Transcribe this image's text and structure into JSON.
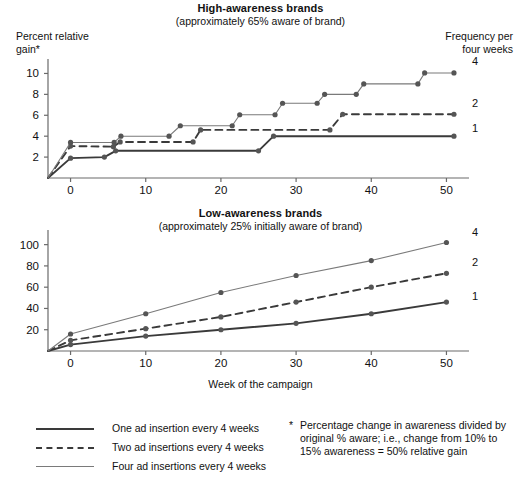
{
  "top": {
    "title": "High-awareness brands",
    "subtitle": "(approximately 65% aware of brand)",
    "ylabel": "Percent relative\ngain*",
    "right_header": "Frequency per\nfour weeks",
    "series_labels": {
      "four": "4",
      "two": "2",
      "one": "1"
    }
  },
  "bottom": {
    "title": "Low-awareness brands",
    "subtitle": "(approximately 25% initially aware of brand)",
    "xlabel": "Week of the campaign",
    "series_labels": {
      "four": "4",
      "two": "2",
      "one": "1"
    }
  },
  "legend": {
    "items": [
      {
        "style": "solid-dark",
        "label": "One ad insertion every 4 weeks"
      },
      {
        "style": "dashed",
        "label": "Two ad insertions every 4 weeks"
      },
      {
        "style": "solid-light",
        "label": "Four ad insertions every 4 weeks"
      }
    ]
  },
  "footnote": {
    "marker": "*",
    "text": "Percentage change in awareness divided by original % aware; i.e., change from 10% to 15% awareness = 50% relative gain"
  },
  "colors": {
    "dark_line": "#3a3a3a",
    "light_line": "#7a7a7a",
    "axis": "#6a6a6a",
    "marker": "#555555",
    "text": "#111111"
  },
  "chart_data": [
    {
      "type": "line",
      "id": "high-awareness",
      "title": "High-awareness brands",
      "subtitle": "(approximately 65% aware of brand)",
      "xlabel": "",
      "ylabel": "Percent relative gain*",
      "xlim": [
        -3,
        53
      ],
      "ylim": [
        0,
        11
      ],
      "xticks": [
        0,
        10,
        20,
        30,
        40,
        50
      ],
      "yticks": [
        2,
        4,
        6,
        8,
        10
      ],
      "grid": false,
      "legend_position": "right-of-plot",
      "note": "step-shaped curves; values are percent relative gain",
      "series": [
        {
          "name": "1",
          "legend": "One ad insertion every 4 weeks",
          "style": "solid-dark",
          "points": [
            {
              "x": -3.0,
              "y": 0.0
            },
            {
              "x": 0.0,
              "y": 1.9
            },
            {
              "x": 4.5,
              "y": 2.0
            },
            {
              "x": 6.0,
              "y": 2.6
            },
            {
              "x": 25.0,
              "y": 2.6
            },
            {
              "x": 27.0,
              "y": 4.0
            },
            {
              "x": 51.0,
              "y": 4.0
            }
          ]
        },
        {
          "name": "2",
          "legend": "Two ad insertions every 4 weeks",
          "style": "dashed",
          "points": [
            {
              "x": -3.0,
              "y": 0.0
            },
            {
              "x": 0.0,
              "y": 3.05
            },
            {
              "x": 5.7,
              "y": 3.0
            },
            {
              "x": 6.6,
              "y": 3.45
            },
            {
              "x": 16.3,
              "y": 3.45
            },
            {
              "x": 17.3,
              "y": 4.6
            },
            {
              "x": 34.5,
              "y": 4.6
            },
            {
              "x": 36.2,
              "y": 6.1
            },
            {
              "x": 51.0,
              "y": 6.1
            }
          ]
        },
        {
          "name": "4",
          "legend": "Four ad insertions every 4 weeks",
          "style": "solid-light",
          "points": [
            {
              "x": -3.0,
              "y": 0.0
            },
            {
              "x": 0.0,
              "y": 3.4
            },
            {
              "x": 5.8,
              "y": 3.4
            },
            {
              "x": 6.7,
              "y": 4.0
            },
            {
              "x": 13.1,
              "y": 4.0
            },
            {
              "x": 14.6,
              "y": 5.0
            },
            {
              "x": 21.5,
              "y": 5.0
            },
            {
              "x": 22.5,
              "y": 6.05
            },
            {
              "x": 27.2,
              "y": 6.05
            },
            {
              "x": 28.2,
              "y": 7.15
            },
            {
              "x": 32.8,
              "y": 7.15
            },
            {
              "x": 33.8,
              "y": 8.0
            },
            {
              "x": 38.0,
              "y": 8.0
            },
            {
              "x": 39.0,
              "y": 9.0
            },
            {
              "x": 46.2,
              "y": 9.0
            },
            {
              "x": 47.1,
              "y": 10.05
            },
            {
              "x": 51.0,
              "y": 10.05
            }
          ]
        }
      ]
    },
    {
      "type": "line",
      "id": "low-awareness",
      "title": "Low-awareness brands",
      "subtitle": "(approximately 25% initially aware of brand)",
      "xlabel": "Week of the campaign",
      "ylabel": "Percent relative gain*",
      "xlim": [
        -3,
        53
      ],
      "ylim": [
        0,
        110
      ],
      "xticks": [
        0,
        10,
        20,
        30,
        40,
        50
      ],
      "yticks": [
        20,
        40,
        60,
        80,
        100
      ],
      "grid": false,
      "legend_position": "right-of-plot",
      "series": [
        {
          "name": "1",
          "legend": "One ad insertion every 4 weeks",
          "style": "solid-dark",
          "points": [
            {
              "x": -3,
              "y": 0
            },
            {
              "x": 0,
              "y": 6
            },
            {
              "x": 10,
              "y": 14
            },
            {
              "x": 20,
              "y": 20
            },
            {
              "x": 30,
              "y": 26
            },
            {
              "x": 40,
              "y": 35
            },
            {
              "x": 50,
              "y": 46
            }
          ]
        },
        {
          "name": "2",
          "legend": "Two ad insertions every 4 weeks",
          "style": "dashed",
          "points": [
            {
              "x": -3,
              "y": 0
            },
            {
              "x": 0,
              "y": 10
            },
            {
              "x": 10,
              "y": 21
            },
            {
              "x": 20,
              "y": 32
            },
            {
              "x": 30,
              "y": 46
            },
            {
              "x": 40,
              "y": 60
            },
            {
              "x": 50,
              "y": 73
            }
          ]
        },
        {
          "name": "4",
          "legend": "Four ad insertions every 4 weeks",
          "style": "solid-light",
          "points": [
            {
              "x": -3,
              "y": 0
            },
            {
              "x": 0,
              "y": 16
            },
            {
              "x": 10,
              "y": 35
            },
            {
              "x": 20,
              "y": 55
            },
            {
              "x": 30,
              "y": 71
            },
            {
              "x": 40,
              "y": 85
            },
            {
              "x": 50,
              "y": 102
            }
          ]
        }
      ]
    }
  ]
}
